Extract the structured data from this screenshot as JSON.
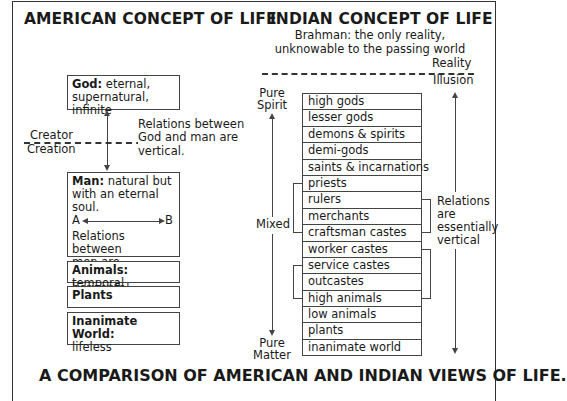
{
  "american": {
    "heading": "AMERICAN CONCEPT OF LIFE",
    "god_box": {
      "label": "God:",
      "text": " eternal,",
      "text2": "supernatural, infinite"
    },
    "divider": {
      "above": "Creator",
      "below": "Creation"
    },
    "vertical_note": [
      "Relations between",
      "God and man are",
      "vertical."
    ],
    "man_box": {
      "label": "Man:",
      "text": " natural but",
      "text2": "with an eternal soul.",
      "point_a": "A",
      "point_b": "B",
      "text3": "Relations between",
      "text4": "men are essentially",
      "text5": "horizontal."
    },
    "animals_box": {
      "label": "Animals:",
      "text": " temporal"
    },
    "plants_box": {
      "label": "Plants"
    },
    "inanimate_box": {
      "label": "Inanimate World:",
      "text": "lifeless"
    }
  },
  "indian": {
    "heading": "INDIAN CONCEPT OF LIFE",
    "brahman": [
      "Brahman: the only reality,",
      "unknowable to the passing world"
    ],
    "divider": {
      "above": "Reality",
      "below": "Illusion"
    },
    "left_axis": {
      "top": [
        "Pure",
        "Spirit"
      ],
      "middle": "Mixed",
      "bottom": [
        "Pure",
        "Matter"
      ]
    },
    "right_note": [
      "Relations",
      "are",
      "essentially",
      "vertical"
    ],
    "ladder": [
      "high gods",
      "lesser gods",
      "demons & spirits",
      "demi-gods",
      "saints & incarnations",
      "priests",
      "rulers",
      "merchants",
      "craftsman castes",
      "worker castes",
      "service castes",
      "outcastes",
      "high animals",
      "low animals",
      "plants",
      "inanimate world"
    ]
  },
  "footer": "A COMPARISON OF AMERICAN AND INDIAN VIEWS OF LIFE."
}
